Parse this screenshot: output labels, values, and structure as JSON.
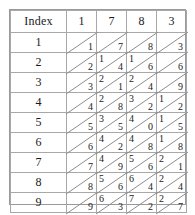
{
  "table": {
    "index_header": "Index",
    "column_headers": [
      "1",
      "7",
      "8",
      "3"
    ],
    "row_indices": [
      "1",
      "2",
      "3",
      "4",
      "5",
      "6",
      "7",
      "8",
      "9"
    ],
    "rows": [
      {
        "index": "1",
        "cells": [
          {
            "tens": "",
            "units": "1"
          },
          {
            "tens": "",
            "units": "7"
          },
          {
            "tens": "",
            "units": "8"
          },
          {
            "tens": "",
            "units": "3"
          }
        ]
      },
      {
        "index": "2",
        "cells": [
          {
            "tens": "",
            "units": "2"
          },
          {
            "tens": "1",
            "units": "4"
          },
          {
            "tens": "1",
            "units": "6"
          },
          {
            "tens": "",
            "units": "6"
          }
        ]
      },
      {
        "index": "3",
        "cells": [
          {
            "tens": "",
            "units": "3"
          },
          {
            "tens": "2",
            "units": "1"
          },
          {
            "tens": "2",
            "units": "4"
          },
          {
            "tens": "",
            "units": "9"
          }
        ]
      },
      {
        "index": "4",
        "cells": [
          {
            "tens": "",
            "units": "4"
          },
          {
            "tens": "2",
            "units": "8"
          },
          {
            "tens": "3",
            "units": "2"
          },
          {
            "tens": "1",
            "units": "2"
          }
        ]
      },
      {
        "index": "5",
        "cells": [
          {
            "tens": "",
            "units": "5"
          },
          {
            "tens": "3",
            "units": "5"
          },
          {
            "tens": "4",
            "units": "0"
          },
          {
            "tens": "1",
            "units": "5"
          }
        ]
      },
      {
        "index": "6",
        "cells": [
          {
            "tens": "",
            "units": "6"
          },
          {
            "tens": "4",
            "units": "2"
          },
          {
            "tens": "4",
            "units": "8"
          },
          {
            "tens": "1",
            "units": "8"
          }
        ]
      },
      {
        "index": "7",
        "cells": [
          {
            "tens": "",
            "units": "7"
          },
          {
            "tens": "4",
            "units": "9"
          },
          {
            "tens": "5",
            "units": "6"
          },
          {
            "tens": "2",
            "units": "1"
          }
        ]
      },
      {
        "index": "8",
        "cells": [
          {
            "tens": "",
            "units": "8"
          },
          {
            "tens": "5",
            "units": "6"
          },
          {
            "tens": "6",
            "units": "4"
          },
          {
            "tens": "2",
            "units": "4"
          }
        ]
      },
      {
        "index": "9",
        "cells": [
          {
            "tens": "",
            "units": "9"
          },
          {
            "tens": "6",
            "units": "3"
          },
          {
            "tens": "7",
            "units": "2"
          },
          {
            "tens": "2",
            "units": "7"
          }
        ]
      }
    ]
  },
  "colors": {
    "border": "#a8a8a8",
    "diagonal": "#8d8d8d",
    "text": "#1a1a1a",
    "background": "#ffffff"
  }
}
